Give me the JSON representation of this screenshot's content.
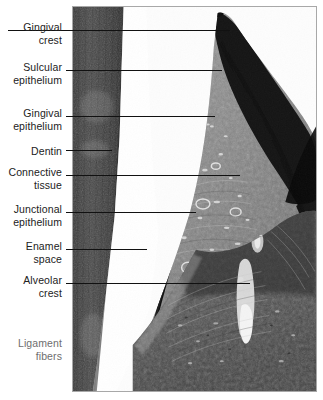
{
  "figure": {
    "background_color": "#ffffff",
    "label_color": "#222222",
    "leader_color": "#111111",
    "frame_color": "#a8a8a8"
  },
  "labels": [
    {
      "id": "gingival-crest",
      "text": "Gingival\ncrest",
      "text_top": 21,
      "leader_y": 30,
      "leader_x1": 66,
      "leader_x2": 230
    },
    {
      "id": "sulcular-epithelium",
      "text": "Sulcular\nepithelium",
      "text_top": 61,
      "leader_y": 70,
      "leader_x2": 222
    },
    {
      "id": "gingival-epithelium",
      "text": "Gingival\nepithelium",
      "text_top": 107,
      "leader_y": 116,
      "leader_x2": 215
    },
    {
      "id": "dentin",
      "text": "Dentin",
      "text_top": 145,
      "leader_y": 150,
      "leader_x2": 112
    },
    {
      "id": "connective-tissue",
      "text": "Connective\ntissue",
      "text_top": 166,
      "leader_y": 175,
      "leader_x2": 240
    },
    {
      "id": "junctional-epithelium",
      "text": "Junctional\nepithelium",
      "text_top": 203,
      "leader_y": 212,
      "leader_x2": 196
    },
    {
      "id": "enamel-space",
      "text": "Enamel\nspace",
      "text_top": 240,
      "leader_y": 249,
      "leader_x2": 147
    },
    {
      "id": "alveolar-crest",
      "text": "Alveolar\ncrest",
      "text_top": 274,
      "leader_y": 283,
      "leader_x2": 250
    },
    {
      "id": "ligament-fibers",
      "text": "Ligament\nfibers",
      "text_top": 337,
      "leader_y": null,
      "leader_x2": null
    }
  ]
}
